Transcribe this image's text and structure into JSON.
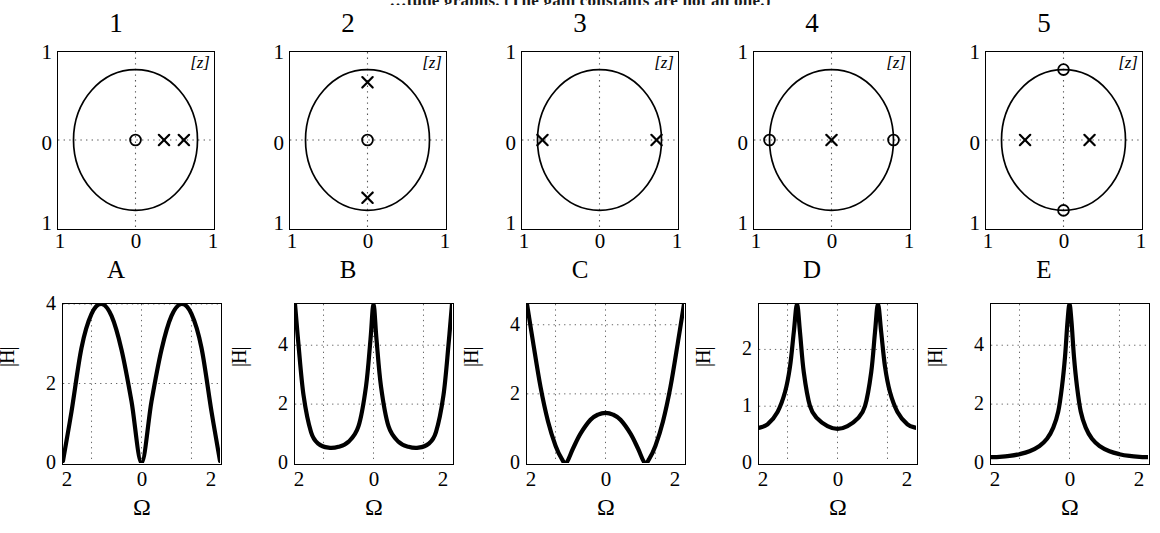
{
  "caption": "…tude graphs. (The gain constants are not all one.)",
  "pole_zero_row": {
    "plane_label": "[z]",
    "y_ticks": [
      "1",
      "0",
      "1"
    ],
    "x_ticks": [
      "1",
      "0",
      "1"
    ],
    "panels": [
      {
        "title": "1",
        "poles": [
          [
            0.46,
            0.0
          ],
          [
            0.78,
            0.0
          ]
        ],
        "zeros": [
          [
            0.0,
            0.0
          ]
        ]
      },
      {
        "title": "2",
        "poles": [
          [
            0.0,
            0.82
          ],
          [
            0.0,
            -0.82
          ]
        ],
        "zeros": [
          [
            0.0,
            0.0
          ]
        ]
      },
      {
        "title": "3",
        "poles": [
          [
            -0.92,
            0.0
          ],
          [
            0.92,
            0.0
          ]
        ],
        "zeros": []
      },
      {
        "title": "4",
        "poles": [
          [
            0.0,
            0.0
          ]
        ],
        "zeros": [
          [
            -1.0,
            0.0
          ],
          [
            1.0,
            0.0
          ]
        ]
      },
      {
        "title": "5",
        "poles": [
          [
            -0.62,
            0.0
          ],
          [
            0.42,
            0.0
          ]
        ],
        "zeros": [
          [
            0.0,
            1.0
          ],
          [
            0.0,
            -1.0
          ]
        ]
      }
    ]
  },
  "magnitude_row": {
    "axis_label_y": "|H|",
    "axis_label_x": "Ω",
    "x_ticks": [
      "2",
      "0",
      "2"
    ],
    "panels": [
      {
        "title": "A",
        "y_ticks": [
          "4",
          "2",
          "0"
        ],
        "ylim": [
          0,
          4
        ]
      },
      {
        "title": "B",
        "y_ticks": [
          "4",
          "2",
          "0"
        ],
        "ylim": [
          0,
          5.4
        ]
      },
      {
        "title": "C",
        "y_ticks": [
          "4",
          "2",
          "0"
        ],
        "ylim": [
          0,
          4.6
        ]
      },
      {
        "title": "D",
        "y_ticks": [
          "2",
          "1",
          "0"
        ],
        "ylim": [
          0,
          2.8
        ]
      },
      {
        "title": "E",
        "y_ticks": [
          "4",
          "2",
          "0"
        ],
        "ylim": [
          0,
          5.4
        ]
      }
    ]
  },
  "chart_data": [
    {
      "type": "scatter",
      "title": "1",
      "subtitle": "z-plane pole-zero plot",
      "xlabel": "Re",
      "ylabel": "Im",
      "xlim": [
        -1.25,
        1.25
      ],
      "ylim": [
        -1.25,
        1.25
      ],
      "grid": true,
      "annotations": [
        "[z]"
      ],
      "series": [
        {
          "name": "poles",
          "marker": "x",
          "points": [
            [
              0.46,
              0.0
            ],
            [
              0.78,
              0.0
            ]
          ]
        },
        {
          "name": "zeros",
          "marker": "o",
          "points": [
            [
              0.0,
              0.0
            ]
          ]
        },
        {
          "name": "unit-circle",
          "marker": "circle",
          "radius": 1.0
        }
      ]
    },
    {
      "type": "scatter",
      "title": "2",
      "subtitle": "z-plane pole-zero plot",
      "xlabel": "Re",
      "ylabel": "Im",
      "xlim": [
        -1.25,
        1.25
      ],
      "ylim": [
        -1.25,
        1.25
      ],
      "grid": true,
      "annotations": [
        "[z]"
      ],
      "series": [
        {
          "name": "poles",
          "marker": "x",
          "points": [
            [
              0.0,
              0.82
            ],
            [
              0.0,
              -0.82
            ]
          ]
        },
        {
          "name": "zeros",
          "marker": "o",
          "points": [
            [
              0.0,
              0.0
            ]
          ]
        },
        {
          "name": "unit-circle",
          "marker": "circle",
          "radius": 1.0
        }
      ]
    },
    {
      "type": "scatter",
      "title": "3",
      "subtitle": "z-plane pole-zero plot",
      "xlabel": "Re",
      "ylabel": "Im",
      "xlim": [
        -1.25,
        1.25
      ],
      "ylim": [
        -1.25,
        1.25
      ],
      "grid": true,
      "annotations": [
        "[z]"
      ],
      "series": [
        {
          "name": "poles",
          "marker": "x",
          "points": [
            [
              -0.92,
              0.0
            ],
            [
              0.92,
              0.0
            ]
          ]
        },
        {
          "name": "zeros",
          "marker": "o",
          "points": []
        },
        {
          "name": "unit-circle",
          "marker": "circle",
          "radius": 1.0
        }
      ]
    },
    {
      "type": "scatter",
      "title": "4",
      "subtitle": "z-plane pole-zero plot",
      "xlabel": "Re",
      "ylabel": "Im",
      "xlim": [
        -1.25,
        1.25
      ],
      "ylim": [
        -1.25,
        1.25
      ],
      "grid": true,
      "annotations": [
        "[z]"
      ],
      "series": [
        {
          "name": "poles",
          "marker": "x",
          "points": [
            [
              0.0,
              0.0
            ]
          ]
        },
        {
          "name": "zeros",
          "marker": "o",
          "points": [
            [
              -1.0,
              0.0
            ],
            [
              1.0,
              0.0
            ]
          ]
        },
        {
          "name": "unit-circle",
          "marker": "circle",
          "radius": 1.0
        }
      ]
    },
    {
      "type": "scatter",
      "title": "5",
      "subtitle": "z-plane pole-zero plot",
      "xlabel": "Re",
      "ylabel": "Im",
      "xlim": [
        -1.25,
        1.25
      ],
      "ylim": [
        -1.25,
        1.25
      ],
      "grid": true,
      "annotations": [
        "[z]"
      ],
      "series": [
        {
          "name": "poles",
          "marker": "x",
          "points": [
            [
              -0.62,
              0.0
            ],
            [
              0.42,
              0.0
            ]
          ]
        },
        {
          "name": "zeros",
          "marker": "o",
          "points": [
            [
              0.0,
              1.0
            ],
            [
              0.0,
              -1.0
            ]
          ]
        },
        {
          "name": "unit-circle",
          "marker": "circle",
          "radius": 1.0
        }
      ]
    },
    {
      "type": "line",
      "title": "A",
      "xlabel": "Ω",
      "ylabel": "|H|",
      "xlim": [
        -3.14159,
        3.14159
      ],
      "ylim": [
        0,
        4
      ],
      "xticks": [
        -2,
        0,
        2
      ],
      "xticklabels": [
        "2",
        "0",
        "2"
      ],
      "yticks": [
        0,
        2,
        4
      ],
      "yticklabels": [
        "0",
        "2",
        "4"
      ],
      "grid": true,
      "x": [
        -3.14159,
        -2.8,
        -2.4,
        -2.0,
        -1.6,
        -1.2,
        -0.8,
        -0.4,
        0,
        0.4,
        0.8,
        1.2,
        1.6,
        2.0,
        2.4,
        2.8,
        3.14159
      ],
      "y": [
        0.05,
        1.3,
        2.9,
        3.75,
        4.0,
        3.7,
        2.85,
        1.55,
        0.0,
        1.55,
        2.85,
        3.7,
        4.0,
        3.75,
        2.9,
        1.3,
        0.05
      ]
    },
    {
      "type": "line",
      "title": "B",
      "xlabel": "Ω",
      "ylabel": "|H|",
      "xlim": [
        -3.14159,
        3.14159
      ],
      "ylim": [
        0,
        5.4
      ],
      "xticks": [
        -2,
        0,
        2
      ],
      "xticklabels": [
        "2",
        "0",
        "2"
      ],
      "yticks": [
        0,
        2,
        4
      ],
      "yticklabels": [
        "0",
        "2",
        "4"
      ],
      "grid": true,
      "x": [
        -3.14159,
        -3.0,
        -2.8,
        -2.5,
        -2.2,
        -1.8,
        -1.4,
        -1.0,
        -0.6,
        -0.3,
        -0.12,
        0,
        0.12,
        0.3,
        0.6,
        1.0,
        1.4,
        1.8,
        2.2,
        2.5,
        2.8,
        3.0,
        3.14159
      ],
      "y": [
        5.4,
        4.0,
        2.3,
        1.05,
        0.65,
        0.52,
        0.55,
        0.72,
        1.25,
        2.6,
        4.2,
        5.4,
        4.2,
        2.6,
        1.25,
        0.72,
        0.55,
        0.52,
        0.65,
        1.05,
        2.3,
        4.0,
        5.4
      ]
    },
    {
      "type": "line",
      "title": "C",
      "xlabel": "Ω",
      "ylabel": "|H|",
      "xlim": [
        -3.14159,
        3.14159
      ],
      "ylim": [
        0,
        4.6
      ],
      "xticks": [
        -2,
        0,
        2
      ],
      "xticklabels": [
        "2",
        "0",
        "2"
      ],
      "yticks": [
        0,
        2,
        4
      ],
      "yticklabels": [
        "0",
        "2",
        "4"
      ],
      "grid": true,
      "x": [
        -3.14159,
        -2.9,
        -2.6,
        -2.3,
        -2.0,
        -1.75,
        -1.57,
        -1.3,
        -1.0,
        -0.6,
        -0.3,
        0,
        0.3,
        0.6,
        1.0,
        1.3,
        1.57,
        1.75,
        2.0,
        2.3,
        2.6,
        2.9,
        3.14159
      ],
      "y": [
        4.6,
        3.5,
        2.2,
        1.2,
        0.5,
        0.12,
        0.0,
        0.42,
        0.85,
        1.25,
        1.4,
        1.45,
        1.4,
        1.25,
        0.85,
        0.42,
        0.0,
        0.12,
        0.5,
        1.2,
        2.2,
        3.5,
        4.6
      ]
    },
    {
      "type": "line",
      "title": "D",
      "xlabel": "Ω",
      "ylabel": "|H|",
      "xlim": [
        -3.14159,
        3.14159
      ],
      "ylim": [
        0,
        2.8
      ],
      "xticks": [
        -2,
        0,
        2
      ],
      "xticklabels": [
        "2",
        "0",
        "2"
      ],
      "yticks": [
        0,
        1,
        2
      ],
      "yticklabels": [
        "0",
        "1",
        "2"
      ],
      "grid": true,
      "x": [
        -3.14159,
        -2.8,
        -2.4,
        -2.1,
        -1.9,
        -1.75,
        -1.62,
        -1.5,
        -1.35,
        -1.1,
        -0.8,
        -0.4,
        0,
        0.4,
        0.8,
        1.1,
        1.35,
        1.5,
        1.62,
        1.75,
        1.9,
        2.1,
        2.4,
        2.8,
        3.14159
      ],
      "y": [
        0.62,
        0.68,
        0.9,
        1.25,
        1.7,
        2.3,
        2.8,
        2.3,
        1.6,
        1.0,
        0.78,
        0.65,
        0.6,
        0.65,
        0.78,
        1.0,
        1.6,
        2.3,
        2.8,
        2.3,
        1.7,
        1.25,
        0.9,
        0.68,
        0.62
      ]
    },
    {
      "type": "line",
      "title": "E",
      "xlabel": "Ω",
      "ylabel": "|H|",
      "xlim": [
        -3.14159,
        3.14159
      ],
      "ylim": [
        0,
        5.4
      ],
      "xticks": [
        -2,
        0,
        2
      ],
      "xticklabels": [
        "2",
        "0",
        "2"
      ],
      "yticks": [
        0,
        2,
        4
      ],
      "yticklabels": [
        "0",
        "2",
        "4"
      ],
      "grid": true,
      "x": [
        -3.14159,
        -2.8,
        -2.4,
        -2.0,
        -1.6,
        -1.2,
        -0.9,
        -0.65,
        -0.45,
        -0.3,
        -0.18,
        -0.08,
        0,
        0.08,
        0.18,
        0.3,
        0.45,
        0.65,
        0.9,
        1.2,
        1.6,
        2.0,
        2.4,
        2.8,
        3.14159
      ],
      "y": [
        0.2,
        0.21,
        0.24,
        0.3,
        0.4,
        0.58,
        0.82,
        1.2,
        1.75,
        2.6,
        3.6,
        4.8,
        5.4,
        4.8,
        3.6,
        2.6,
        1.75,
        1.2,
        0.82,
        0.58,
        0.4,
        0.3,
        0.24,
        0.21,
        0.2
      ]
    }
  ]
}
